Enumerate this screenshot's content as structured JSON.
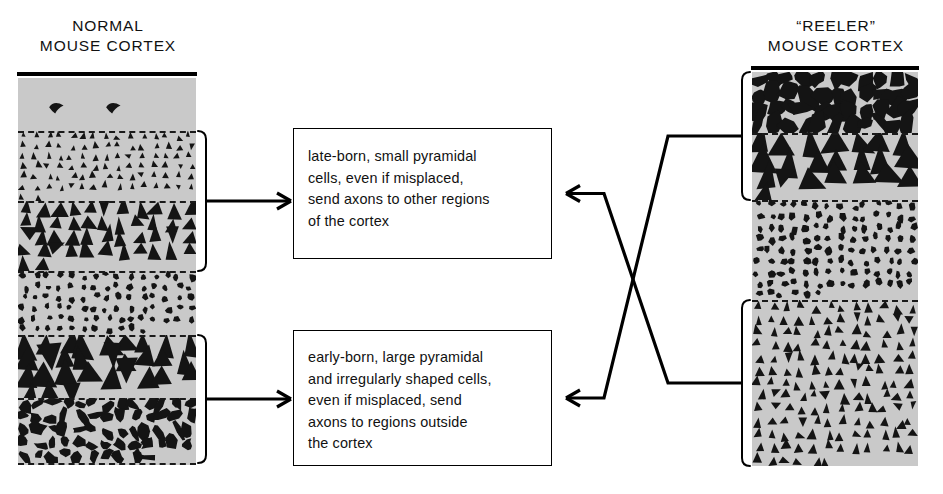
{
  "figure": {
    "type": "diagram"
  },
  "columns": {
    "normal": {
      "title": "NORMAL\nMOUSE CORTEX",
      "title_line1": "NORMAL",
      "title_line2": "MOUSE CORTEX",
      "x": 18,
      "y": 78,
      "width": 178,
      "height": 387,
      "fill_color": "#c9c9c9",
      "layers": [
        {
          "name": "marginal-zone",
          "cell_type": "sparse-curved",
          "top": 78,
          "bottom": 131,
          "density": 2,
          "cell_scale": 1.0,
          "seed": 11
        },
        {
          "name": "small-pyramidal-upper",
          "cell_type": "pyramid",
          "top": 131,
          "bottom": 201,
          "density": 92,
          "cell_scale": 0.52,
          "seed": 21
        },
        {
          "name": "medium-pyramidal",
          "cell_type": "pyramid",
          "top": 201,
          "bottom": 271,
          "density": 46,
          "cell_scale": 0.92,
          "seed": 31
        },
        {
          "name": "granular-small-cells",
          "cell_type": "blob-small",
          "top": 271,
          "bottom": 335,
          "density": 86,
          "cell_scale": 0.55,
          "seed": 41
        },
        {
          "name": "large-pyramidal",
          "cell_type": "pyramid",
          "top": 335,
          "bottom": 398,
          "density": 30,
          "cell_scale": 1.25,
          "seed": 51
        },
        {
          "name": "irregular-polymorph",
          "cell_type": "blob-irregular",
          "top": 398,
          "bottom": 463,
          "density": 62,
          "cell_scale": 0.85,
          "seed": 61
        }
      ],
      "dashed_boundaries": [
        131,
        201,
        271,
        335,
        398,
        463
      ],
      "brackets": [
        {
          "name": "bracket-normal-upper",
          "top": 131,
          "bottom": 271,
          "side": "right",
          "target": "box-late"
        },
        {
          "name": "bracket-normal-lower",
          "top": 335,
          "bottom": 463,
          "side": "right",
          "target": "box-early"
        }
      ]
    },
    "reeler": {
      "title": "“REELER”\nMOUSE CORTEX",
      "title_line1": "“REELER”",
      "title_line2": "MOUSE CORTEX",
      "x": 752,
      "y": 72,
      "width": 166,
      "height": 394,
      "fill_color": "#c9c9c9",
      "layers": [
        {
          "name": "irregular-polymorph",
          "cell_type": "blob-irregular",
          "top": 72,
          "bottom": 133,
          "density": 44,
          "cell_scale": 1.15,
          "seed": 71
        },
        {
          "name": "large-pyramidal",
          "cell_type": "pyramid",
          "top": 133,
          "bottom": 200,
          "density": 22,
          "cell_scale": 1.35,
          "seed": 81
        },
        {
          "name": "granular-small-cells",
          "cell_type": "blob-small",
          "top": 200,
          "bottom": 300,
          "density": 118,
          "cell_scale": 0.58,
          "seed": 91
        },
        {
          "name": "small-pyramidal-dense",
          "cell_type": "pyramid",
          "top": 300,
          "bottom": 466,
          "density": 150,
          "cell_scale": 0.6,
          "seed": 101
        }
      ],
      "dashed_boundaries": [
        133,
        200,
        300,
        466
      ],
      "brackets": [
        {
          "name": "bracket-reeler-upper",
          "top": 72,
          "bottom": 200,
          "side": "left",
          "target": "box-early"
        },
        {
          "name": "bracket-reeler-lower",
          "top": 300,
          "bottom": 466,
          "side": "left",
          "target": "box-late"
        }
      ]
    }
  },
  "boxes": {
    "late": {
      "id": "box-late",
      "text": "late-born, small pyramidal\ncells, even if misplaced,\nsend axons to other regions\nof the cortex",
      "lines": [
        "late-born, small pyramidal",
        "cells, even if misplaced,",
        "send axons to other regions",
        "of the cortex"
      ]
    },
    "early": {
      "id": "box-early",
      "text": "early-born, large pyramidal\nand irregularly shaped cells,\neven if misplaced, send\naxons to regions outside\nthe cortex",
      "lines": [
        "early-born, large pyramidal",
        "and irregularly shaped cells,",
        "even if misplaced, send",
        "axons to regions outside",
        "the cortex"
      ]
    }
  },
  "connectors": [
    {
      "name": "arrow-normal-upper-to-late-box",
      "from": "bracket-normal-upper",
      "to": "box-late",
      "direction": "right",
      "style": "straight"
    },
    {
      "name": "arrow-normal-lower-to-early-box",
      "from": "bracket-normal-lower",
      "to": "box-early",
      "direction": "right",
      "style": "straight"
    },
    {
      "name": "arrow-reeler-upper-to-early-box",
      "from": "bracket-reeler-upper",
      "to": "box-early",
      "direction": "left",
      "style": "crossed"
    },
    {
      "name": "arrow-reeler-lower-to-late-box",
      "from": "bracket-reeler-lower",
      "to": "box-late",
      "direction": "left",
      "style": "crossed"
    }
  ],
  "colors": {
    "background": "#ffffff",
    "cortex_fill": "#c9c9c9",
    "cell_fill": "#141414",
    "line": "#000000",
    "text": "#111111"
  }
}
